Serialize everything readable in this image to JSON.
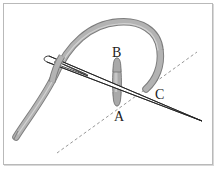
{
  "diagram": {
    "labels": {
      "a": "A",
      "b": "B",
      "c": "C"
    },
    "colors": {
      "thread": "#a9a9a9",
      "thread_shade": "#7d7d7d",
      "needle_outline": "#222222",
      "stitch_line": "#8a8a8a",
      "frame_border": "#b9b9b9"
    },
    "elements": [
      "thread",
      "needle",
      "stitch",
      "dashed-stitch-line"
    ]
  }
}
